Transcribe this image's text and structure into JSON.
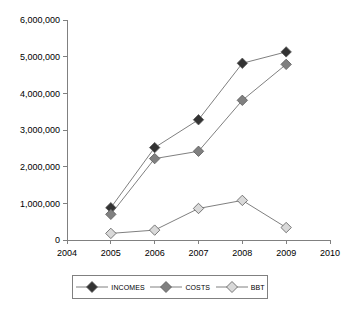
{
  "chart_data": {
    "type": "line",
    "title": "",
    "xlabel": "",
    "ylabel": "",
    "x": [
      2004,
      2005,
      2006,
      2007,
      2008,
      2009,
      2010
    ],
    "xtick_labels": [
      "2004",
      "2005",
      "2006",
      "2007",
      "2008",
      "2009",
      "2010"
    ],
    "xlim": [
      2004,
      2010
    ],
    "ylim": [
      0,
      6000000
    ],
    "ytick_labels": [
      "0",
      "1,000,000",
      "2,000,000",
      "3,000,000",
      "4,000,000",
      "5,000,000",
      "6,000,000"
    ],
    "ytick_values": [
      0,
      1000000,
      2000000,
      3000000,
      4000000,
      5000000,
      6000000
    ],
    "grid": false,
    "legend_position": "bottom",
    "marker": "diamond",
    "categories": [
      2005,
      2006,
      2007,
      2008,
      2009
    ],
    "series": [
      {
        "name": "INCOMES",
        "color": "#333333",
        "x": [
          2005,
          2006,
          2007,
          2008,
          2009
        ],
        "values": [
          880000,
          2520000,
          3280000,
          4820000,
          5130000
        ]
      },
      {
        "name": "COSTS",
        "color": "#808080",
        "x": [
          2005,
          2006,
          2007,
          2008,
          2009
        ],
        "values": [
          700000,
          2220000,
          2420000,
          3810000,
          4790000
        ]
      },
      {
        "name": "BBT",
        "color": "#D9D9D9",
        "x": [
          2005,
          2006,
          2007,
          2008,
          2009
        ],
        "values": [
          180000,
          270000,
          860000,
          1080000,
          340000
        ]
      }
    ]
  },
  "legend": {
    "entries": [
      {
        "label": "INCOMES"
      },
      {
        "label": "COSTS"
      },
      {
        "label": "BBT"
      }
    ]
  },
  "colors": {
    "axis": "#808080",
    "line": "#808080",
    "marker_border": "#595959",
    "background": "#FFFFFF",
    "text": "#000000"
  }
}
